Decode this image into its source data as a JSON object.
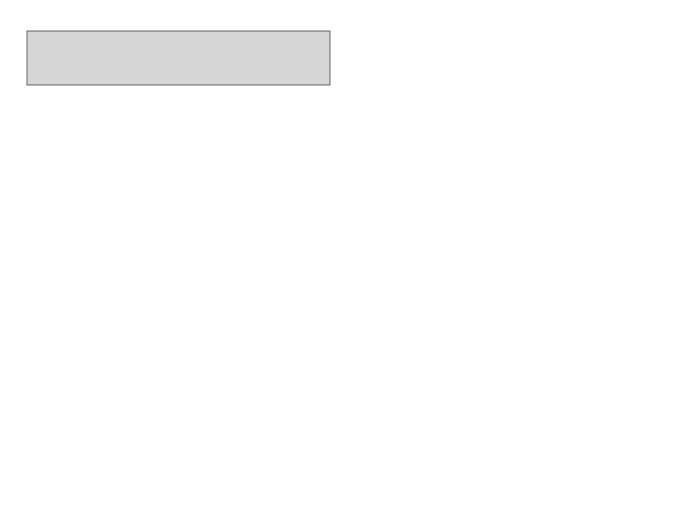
{
  "colors": {
    "frame_bg": "#d6d6d6",
    "canada": "#a9a9a9",
    "district_dark": "#a8a8a8",
    "district_light": "#efefef",
    "district_mid": "#c4c4c4",
    "water": "#bdbdbd",
    "border": "#111111"
  },
  "regions": {
    "western_canada": {
      "label": "WESTERN CANADA",
      "number": "22",
      "railroads": [
        "CN",
        "CP",
        "GN",
        "MStP&SSM",
        "NP",
        "SOO"
      ]
    },
    "eastern_canada": {
      "label": "EASTERN CANADA",
      "number": "23",
      "railroads": [
        "AC&HB",
        "B&A",
        "CASO",
        "CCC&StL",
        "CN",
        "CP",
        "MC",
        "NYC",
        "ONT",
        "P&E",
        "QC",
        "TEM",
        "THB"
      ]
    }
  },
  "districts": [
    {
      "number": "1",
      "states": [
        "WASHINGTON",
        "OREGON"
      ],
      "railroads": [
        "CN",
        "CP",
        "CMStP&P",
        "CTSE",
        "GN",
        "LA&SL",
        "MILW",
        "NP",
        "OSL",
        "OWR&N",
        "SI",
        "SP",
        "SP&S",
        "UP"
      ]
    },
    {
      "number": "2",
      "states": [
        "NEVADA",
        "CALIFORNIA"
      ],
      "railroads": [
        "AT&SF",
        "LA&SL",
        "NWP",
        "OSL",
        "OWR&N",
        "PE",
        "SN&AE",
        "SP",
        "UP",
        "WP"
      ]
    },
    {
      "number": "3",
      "states": [
        "MONTANA"
      ],
      "railroads": [
        "CN",
        "CP",
        "CMStP&P",
        "CTSE",
        "GN",
        "MILW",
        "NP"
      ]
    },
    {
      "number": "4",
      "states": [
        "WYOMING"
      ],
      "railroads": [
        "C&NW",
        "CB&Q",
        "CMStP&LO",
        "C&S",
        "C&W",
        "LA&SL",
        "OSL",
        "OWR&N",
        "UP"
      ]
    },
    {
      "number": "5",
      "states": [
        "UTAH",
        "COLORADO"
      ],
      "railroads": [
        "AT&SF",
        "CB&Q",
        "CRI&P",
        "C&S",
        "C&W",
        "D&RGW",
        "D&SL",
        "LA&SL",
        "OSL",
        "OWR&N",
        "RI",
        "SP",
        "UCR",
        "UP",
        "UTAH",
        "WP"
      ]
    },
    {
      "number": "6",
      "states": [
        "ARIZONA",
        "NEW MEXICO"
      ],
      "railroads": [
        "AT&SF",
        "CRI&P",
        "C&S",
        "RI",
        "SN&AE",
        "SP"
      ]
    },
    {
      "number": "7",
      "states": [
        "NORTH DAKOTA",
        "SOUTH DAKOTA"
      ],
      "railroads": [
        "CN",
        "CP",
        "C&NW",
        "CMStP&P",
        "CStPM&O",
        "CTSE",
        "GN",
        "MILW",
        "M&StL",
        "MStP&SSM",
        "NP",
        "SOO"
      ]
    },
    {
      "number": "8",
      "states": [
        "NEBRASKA",
        "KANSAS"
      ],
      "railroads": [
        "AT&SF",
        "C&NW",
        "CB&Q",
        "CRI&P",
        "CStPM&O",
        "KCS",
        "LA&SL",
        "MKT",
        "MP",
        "MV",
        "OSL",
        "OWR&N",
        "RI",
        "SLSF",
        "UP"
      ]
    },
    {
      "number": "9",
      "states": [
        "OKLAHOMA"
      ],
      "railroads": [
        "AT&SF",
        "CRI&P",
        "KCS",
        "KO&G",
        "MV",
        "MKT",
        "MP",
        "RI",
        "SLSF"
      ]
    },
    {
      "number": "10",
      "states": [
        "TEXAS"
      ],
      "railroads": [
        "AT&SF",
        "CRI&P",
        "FW&D",
        "GCS",
        "IGN",
        "KCS",
        "L&A",
        "MKT",
        "NO&M",
        "NOT&M",
        "RI",
        "StLB&M",
        "SLSF",
        "SLSW",
        "SSW",
        "T&NO",
        "TN",
        "T&P",
        "WF&S"
      ]
    },
    {
      "number": "11",
      "states": [
        "MINNESOTA",
        "IOWA",
        "WISCONSIN"
      ],
      "railroads": [
        "CN",
        "CP",
        "C&NW",
        "CB&Q",
        "CGW",
        "CMStP&P",
        "COP RANGE",
        "CRI&P",
        "CStPM&O",
        "CTSE",
        "DM&IR",
        "DSS&A",
        "DW&P",
        "GB&W",
        "GN",
        "IC",
        "LS&I",
        "M&StL",
        "MILW",
        "MStP&SSM",
        "NP",
        "RI",
        "SOO",
        "WAB"
      ]
    },
    {
      "number": "12",
      "states": [
        "MISSOURI"
      ],
      "railroads": [
        "AT&SF",
        "CB&Q",
        "CGW",
        "CMStP&P",
        "CRI&P",
        "CTSE",
        "GM&O",
        "KCS",
        "MILW",
        "MKT",
        "MP",
        "RI",
        "SLSF",
        "SLSW",
        "SSW",
        "WAB"
      ]
    },
    {
      "number": "13",
      "states": [
        "ARKANSAS",
        "LOUISIANA"
      ],
      "railroads": [
        "CRI&P",
        "GCL",
        "GM&O",
        "IC",
        "KCS",
        "L&A",
        "MP",
        "NOT&M",
        "RI",
        "StLB&M",
        "SLSF",
        "SLSW",
        "SSW",
        "T&NO",
        "T&P"
      ]
    },
    {
      "number": "14",
      "states": [
        "ILLINOIS"
      ],
      "note": "See insert at right",
      "railroads": [
        "AT&SF",
        "B&A",
        "B&O",
        "C&O",
        "C&EI",
        "C&NW",
        "CB&Q",
        "CGW",
        "CMStP&P",
        "CRI&P",
        "CStPM&O",
        "CTSE",
        "CCC&StL",
        "EJ&E",
        "ERIE",
        "GM&O",
        "IC",
        "ITC",
        "L&N",
        "MC",
        "MILW",
        "M&StL",
        "MStP&SSM",
        "MP",
        "NKP",
        "NYC",
        "PRR",
        "P&E",
        "PM",
        "RI",
        "SOO",
        "SOU",
        "SLSW",
        "SSW",
        "TP&W",
        "WAB",
        "W&LE"
      ]
    },
    {
      "number": "15",
      "states": [
        "MICHIGAN",
        "INDIANA",
        "OHIO"
      ],
      "railroads": [
        "AA",
        "AC&P",
        "B&A",
        "B&O",
        "CCC&StL",
        "C&EI",
        "C&O",
        "D&M",
        "DT&I",
        "DT&SL",
        "ERIE",
        "GTW",
        "MC",
        "NJ&I",
        "NKP",
        "N&W",
        "NYC",
        "PRR",
        "P&E",
        "PM&B",
        "P&LE",
        "PM",
        "P&WV",
        "SOU",
        "TP&W",
        "WAB",
        "W&LE"
      ]
    },
    {
      "number": "16",
      "states": [
        "N.Y.",
        "PA."
      ],
      "railroads": [
        "B&A",
        "B&O",
        "B&LE",
        "CRI",
        "CCC&StL",
        "CNJ",
        "CRP",
        "D&H",
        "DL&W",
        "ERIE",
        "L&HR",
        "LI",
        "LV",
        "MONTOUR",
        "NC",
        "NH",
        "NKP",
        "NYC",
        "NYO&W",
        "NYS&W",
        "PRR",
        "P&E",
        "P&LE",
        "P&S",
        "P&WV",
        "PM&KY",
        "RDG",
        "UNE",
        "W&LE",
        "WM"
      ]
    },
    {
      "number": "17",
      "states": [
        "MAINE",
        "NEW HAMPSHIRE",
        "VT.",
        "MASSACHUSETTS",
        "RHODE ISLAND",
        "CONNECTICUT"
      ],
      "railroads": [
        "B&M",
        "B&A",
        "B&AR",
        "CCC&StL",
        "CN",
        "CP",
        "CV",
        "MEC",
        "MC",
        "NH",
        "NYC",
        "P&E",
        "RUT"
      ]
    },
    {
      "number": "18",
      "states": [
        "KENTUCKY",
        "TENNESSEE"
      ],
      "railroads": [
        "CC&O",
        "CNR",
        "C&O",
        "GM&O",
        "IC",
        "L&N",
        "N&C",
        "NC&StL",
        "PM",
        "SOU",
        "TC"
      ]
    },
    {
      "number": "19",
      "states": [
        "W. VA.",
        "VA.",
        "MARYLAND",
        "DELAWARE",
        "NEW JERSEY"
      ],
      "railroads": [
        "ACL",
        "A&D",
        "B&A",
        "B&O",
        "CCC&StL",
        "C&O",
        "N&W",
        "NC",
        "NYC",
        "PM",
        "PRR",
        "P&E",
        "RF&P",
        "SAL",
        "SOU",
        "VGN",
        "WM"
      ]
    },
    {
      "number": "20",
      "states": [
        "N.C.",
        "S.C."
      ],
      "railroads": [
        "ACL",
        "CC&O",
        "C&WC",
        "CRR",
        "G&F",
        "NS",
        "SAL",
        "SOU",
        "WWS"
      ]
    },
    {
      "number": "21",
      "states": [
        "MISSISSIPPI",
        "ALABAMA",
        "GEORGIA"
      ],
      "railroads": [
        "ACL",
        "A&WP",
        "BS",
        "CG",
        "C&G",
        "FEC",
        "GA",
        "G&F",
        "GM&O",
        "IC",
        "L&N",
        "MSL",
        "N&C",
        "NC&StL",
        "SA",
        "SAL",
        "SOU",
        "StLSF",
        "WofA"
      ]
    },
    {
      "number": "",
      "states": [
        "IDAHO",
        "FLORIDA"
      ],
      "railroads": []
    }
  ],
  "illinois_insert": {
    "label": "ILLINOIS",
    "number": "14",
    "col1": [
      "AT&SF",
      "B&A",
      "B&O",
      "C&O",
      "C&EI",
      "C&NW",
      "CB&Q"
    ],
    "col2": [
      "C&W",
      "C&EI",
      "CMStP&P",
      "CRI&P",
      "CStPM&O",
      "CTSE",
      "CCC&StL",
      "EJ&E",
      "ERIE",
      "GM&O",
      "IC",
      "ITC"
    ],
    "col3": [
      "L&N",
      "MC",
      "MILW",
      "M&StL",
      "MStP&SSM",
      "MI",
      "MP",
      "NKP",
      "NYC",
      "PRR",
      "P&E",
      "PM",
      "RI",
      "SOO",
      "SOU",
      "SLSW",
      "SSW",
      "TP&W",
      "WAB",
      "W&LE"
    ]
  }
}
